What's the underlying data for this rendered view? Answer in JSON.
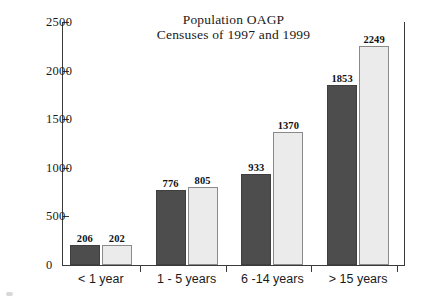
{
  "chart_data": {
    "type": "bar",
    "title": "Population OAGP\nCensuses of 1997 and 1999",
    "title_lines": [
      "Population OAGP",
      "Censuses of 1997 and 1999"
    ],
    "xlabel": "",
    "ylabel": "",
    "ylim": [
      0,
      2500
    ],
    "yticks": [
      0,
      500,
      1000,
      1500,
      2000,
      2500
    ],
    "ytick_labels": [
      "0",
      "500",
      "1000",
      "1500",
      "2000",
      "2500"
    ],
    "grid": false,
    "legend": false,
    "categories": [
      "< 1 year",
      "1 - 5 years",
      "6 -14 years",
      "> 15 years"
    ],
    "series": [
      {
        "name": "Census 1997",
        "color": "#4d4d4d",
        "values": [
          206,
          776,
          933,
          1853
        ],
        "labels": [
          "206",
          "776",
          "933",
          "1853"
        ]
      },
      {
        "name": "Census 1999",
        "color": "#ebebeb",
        "values": [
          202,
          805,
          1370,
          2249
        ],
        "labels": [
          "202",
          "805",
          "1370",
          "2249"
        ]
      }
    ]
  },
  "axes": {
    "y_max_label": "2500",
    "y_min_label": "0"
  }
}
